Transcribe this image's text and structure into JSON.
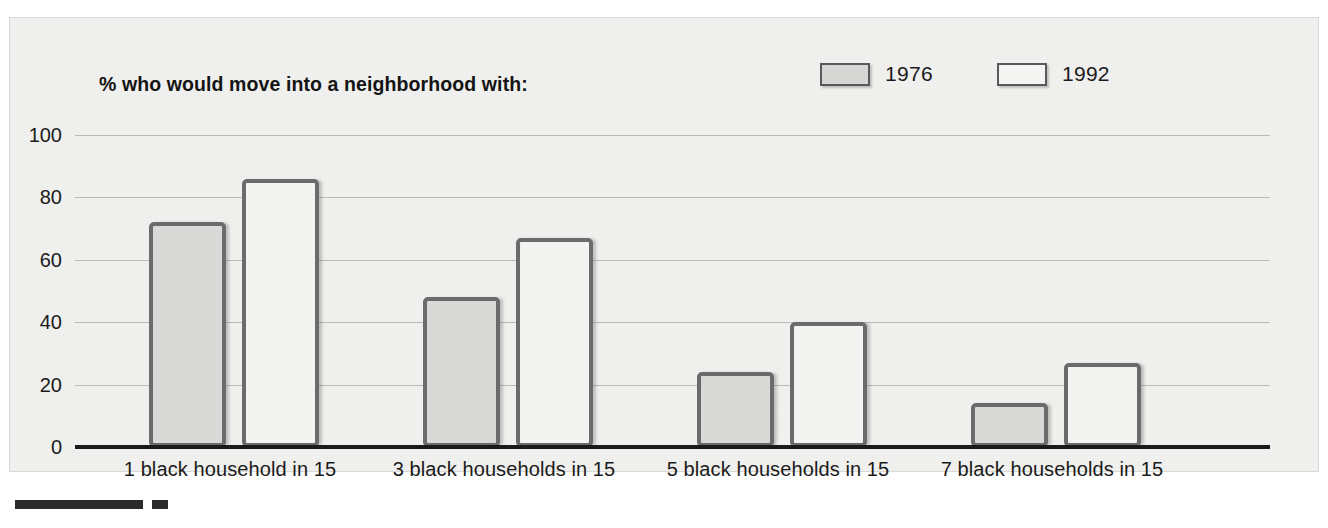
{
  "chart_data": {
    "type": "bar",
    "title": "% who would move into a neighborhood with:",
    "xlabel": "",
    "ylabel": "",
    "ylim": [
      0,
      100
    ],
    "yticks": [
      100,
      80,
      60,
      40,
      20,
      0
    ],
    "grid": true,
    "legend_position": "top-right",
    "categories": [
      "1 black household in 15",
      "3 black households in 15",
      "5 black households in 15",
      "7 black households in 15"
    ],
    "series": [
      {
        "name": "1976",
        "color": "#d9d9d7",
        "values": [
          72,
          48,
          24,
          14
        ]
      },
      {
        "name": "1992",
        "color": "#f3f3f1",
        "values": [
          86,
          67,
          40,
          27
        ]
      }
    ]
  },
  "legend": {
    "items": [
      {
        "label": "1976",
        "swatch": "filled-gray-swatch"
      },
      {
        "label": "1992",
        "swatch": "filled-white-swatch"
      }
    ]
  },
  "axis": {
    "y_labels": [
      "100",
      "80",
      "60",
      "40",
      "20",
      "0"
    ]
  }
}
